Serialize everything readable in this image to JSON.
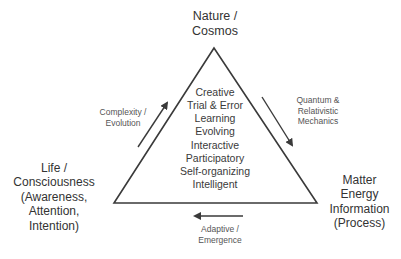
{
  "diagram": {
    "type": "triangle",
    "colors": {
      "line": "#3a3a3a",
      "text": "#333333",
      "background": "#ffffff"
    },
    "vertices": {
      "top": {
        "lines": [
          "Nature /",
          "Cosmos"
        ]
      },
      "left": {
        "lines": [
          "Life /",
          "Consciousness",
          "(Awareness,",
          "Attention,",
          "Intention)"
        ]
      },
      "right": {
        "lines": [
          "Matter",
          "Energy",
          "Information",
          "(Process)"
        ]
      }
    },
    "center": {
      "lines": [
        "Creative",
        "Trial & Error",
        "Learning",
        "Evolving",
        "Interactive",
        "Participatory",
        "Self-organizing",
        "Intelligent"
      ]
    },
    "edges": {
      "left": {
        "lines": [
          "Complexity /",
          "Evolution"
        ],
        "arrow_direction": "up-right",
        "from": "Life / Consciousness",
        "to": "Nature / Cosmos"
      },
      "right": {
        "lines": [
          "Quantum &",
          "Relativistic",
          "Mechanics"
        ],
        "arrow_direction": "down-right",
        "from": "Nature / Cosmos",
        "to": "Matter Energy Information"
      },
      "bottom": {
        "lines": [
          "Adaptive /",
          "Emergence"
        ],
        "arrow_direction": "left",
        "from": "Matter Energy Information",
        "to": "Life / Consciousness"
      }
    }
  }
}
